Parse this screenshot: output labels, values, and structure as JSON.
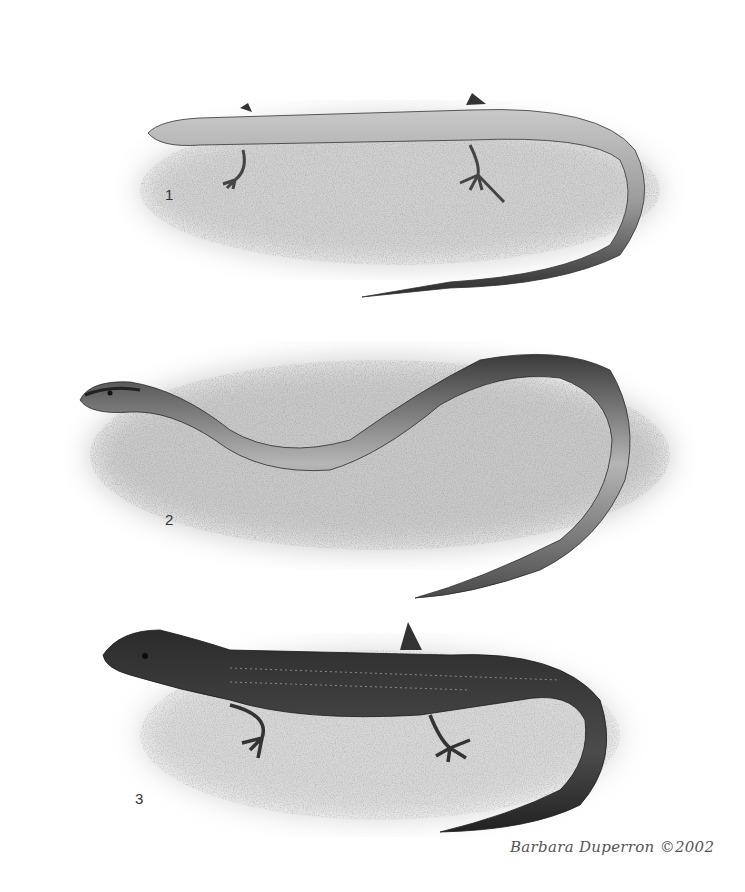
{
  "plate": {
    "background": "#ffffff",
    "figures": [
      {
        "number": "1",
        "label_pos": [
          165,
          187
        ],
        "description": "slender skink-like lizard, dorsal view, body extended right with tail curving back left",
        "color": "#8a8a8a"
      },
      {
        "number": "2",
        "label_pos": [
          165,
          512
        ],
        "description": "long serpentine lizard with head stripes, S-curved body, reduced limbs",
        "color": "#707070"
      },
      {
        "number": "3",
        "label_pos": [
          135,
          791
        ],
        "description": "dark striped lizard with spotted tail, lateral view",
        "color": "#3d3d3d"
      }
    ],
    "signature": "Barbara Duperron ©2002"
  }
}
